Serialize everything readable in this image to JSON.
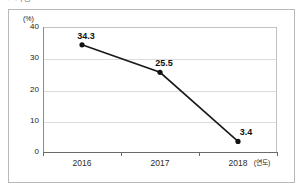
{
  "top_fragment": {
    "text": "● 가정"
  },
  "chart_data": {
    "type": "line",
    "title": "",
    "subtitle": "",
    "xlabel": "(연도)",
    "ylabel": "",
    "unit_label": "(%)",
    "categories": [
      "2016",
      "2017",
      "2018"
    ],
    "x_axis_suffix": "(연도)",
    "values": [
      34.3,
      25.5,
      3.4
    ],
    "point_labels": [
      "34.3",
      "25.5",
      "3.4"
    ],
    "ylim": [
      0,
      40
    ],
    "yticks": [
      40,
      30,
      20,
      10,
      0
    ],
    "ytick_labels": [
      "40",
      "30",
      "20",
      "10",
      "0"
    ],
    "grid": true,
    "legend": "none",
    "series": [
      {
        "name": "",
        "values": [
          34.3,
          25.5,
          3.4
        ],
        "line_color": "#1a1a1a",
        "marker": "circle",
        "marker_color": "#111111"
      }
    ],
    "colors": {
      "line": "#1a1a1a",
      "marker": "#111111",
      "gridline": "#dcdcdc",
      "axis": "#6a6a6a",
      "plot_border": "#c2c2c2",
      "figure_border": "#b9b9b9",
      "text": "#1a1a1a",
      "background": "#ffffff"
    }
  }
}
